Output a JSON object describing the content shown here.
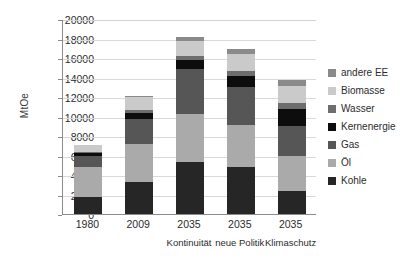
{
  "chart_data": {
    "type": "bar",
    "subtype": "stacked-column",
    "title": "",
    "xlabel": "",
    "ylabel": "MtOe",
    "ylim": [
      0,
      20000
    ],
    "ytick_step": 2000,
    "yticks": [
      "20000",
      "18000",
      "16000",
      "14000",
      "12000",
      "10000",
      "8000",
      "6000",
      "4000",
      "2000",
      "0"
    ],
    "grid": true,
    "legend_position": "right",
    "categories": [
      "1980",
      "2009",
      "2035",
      "2035",
      "2035"
    ],
    "category_sublabels": [
      "",
      "",
      "Kontinuität",
      "neue Politik",
      "Klimaschutz"
    ],
    "series": [
      {
        "name": "Kohle",
        "color": "#262626",
        "values": [
          1700,
          3300,
          5350,
          4800,
          2350
        ]
      },
      {
        "name": "Öl",
        "color": "#aaaaaa",
        "values": [
          3100,
          3850,
          4900,
          4300,
          3550
        ]
      },
      {
        "name": "Gas",
        "color": "#565656",
        "values": [
          1200,
          2550,
          4650,
          3950,
          3100
        ]
      },
      {
        "name": "Kernenergie",
        "color": "#0d0d0d",
        "values": [
          250,
          700,
          950,
          1150,
          1750
        ]
      },
      {
        "name": "Wasser",
        "color": "#6e6e6e",
        "values": [
          150,
          250,
          400,
          500,
          600
        ]
      },
      {
        "name": "Biomasse",
        "color": "#cacaca",
        "values": [
          650,
          1350,
          1550,
          1700,
          1800
        ]
      },
      {
        "name": "andere EE",
        "color": "#8a8a8a",
        "values": [
          50,
          150,
          400,
          500,
          550
        ]
      }
    ],
    "totals": [
      7100,
      12150,
      18200,
      16900,
      13700
    ],
    "legend_order_top_to_bottom": [
      "andere EE",
      "Biomasse",
      "Wasser",
      "Kernenergie",
      "Gas",
      "Öl",
      "Kohle"
    ]
  }
}
